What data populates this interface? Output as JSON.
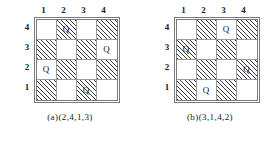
{
  "figure_type": "chessboard-permutation-diagram",
  "boards": [
    {
      "id": "board-a",
      "caption": "(a)(2,4,1,3)",
      "col_labels": [
        "1",
        "2",
        "3",
        "4"
      ],
      "row_labels": [
        "4",
        "3",
        "2",
        "1"
      ],
      "queen_glyph": "Q",
      "permutation": [
        2,
        4,
        1,
        3
      ],
      "rows_top_to_bottom": [
        {
          "row_label": "4",
          "cells": [
            {
              "col": "1",
              "shaded": false,
              "queen": ""
            },
            {
              "col": "2",
              "shaded": true,
              "queen": "Q"
            },
            {
              "col": "3",
              "shaded": false,
              "queen": ""
            },
            {
              "col": "4",
              "shaded": true,
              "queen": ""
            }
          ]
        },
        {
          "row_label": "3",
          "cells": [
            {
              "col": "1",
              "shaded": true,
              "queen": ""
            },
            {
              "col": "2",
              "shaded": false,
              "queen": ""
            },
            {
              "col": "3",
              "shaded": true,
              "queen": ""
            },
            {
              "col": "4",
              "shaded": false,
              "queen": "Q"
            }
          ]
        },
        {
          "row_label": "2",
          "cells": [
            {
              "col": "1",
              "shaded": false,
              "queen": "Q"
            },
            {
              "col": "2",
              "shaded": true,
              "queen": ""
            },
            {
              "col": "3",
              "shaded": false,
              "queen": ""
            },
            {
              "col": "4",
              "shaded": true,
              "queen": ""
            }
          ]
        },
        {
          "row_label": "1",
          "cells": [
            {
              "col": "1",
              "shaded": true,
              "queen": ""
            },
            {
              "col": "2",
              "shaded": false,
              "queen": ""
            },
            {
              "col": "3",
              "shaded": true,
              "queen": "Q"
            },
            {
              "col": "4",
              "shaded": false,
              "queen": ""
            }
          ]
        }
      ]
    },
    {
      "id": "board-b",
      "caption": "(b)(3,1,4,2)",
      "col_labels": [
        "1",
        "2",
        "3",
        "4"
      ],
      "row_labels": [
        "4",
        "3",
        "2",
        "1"
      ],
      "queen_glyph": "Q",
      "permutation": [
        3,
        1,
        4,
        2
      ],
      "rows_top_to_bottom": [
        {
          "row_label": "4",
          "cells": [
            {
              "col": "1",
              "shaded": false,
              "queen": ""
            },
            {
              "col": "2",
              "shaded": true,
              "queen": ""
            },
            {
              "col": "3",
              "shaded": false,
              "queen": "Q"
            },
            {
              "col": "4",
              "shaded": true,
              "queen": ""
            }
          ]
        },
        {
          "row_label": "3",
          "cells": [
            {
              "col": "1",
              "shaded": true,
              "queen": "Q"
            },
            {
              "col": "2",
              "shaded": false,
              "queen": ""
            },
            {
              "col": "3",
              "shaded": true,
              "queen": ""
            },
            {
              "col": "4",
              "shaded": false,
              "queen": ""
            }
          ]
        },
        {
          "row_label": "2",
          "cells": [
            {
              "col": "1",
              "shaded": false,
              "queen": ""
            },
            {
              "col": "2",
              "shaded": true,
              "queen": ""
            },
            {
              "col": "3",
              "shaded": false,
              "queen": ""
            },
            {
              "col": "4",
              "shaded": true,
              "queen": "Q"
            }
          ]
        },
        {
          "row_label": "1",
          "cells": [
            {
              "col": "1",
              "shaded": true,
              "queen": ""
            },
            {
              "col": "2",
              "shaded": false,
              "queen": "Q"
            },
            {
              "col": "3",
              "shaded": true,
              "queen": ""
            },
            {
              "col": "4",
              "shaded": false,
              "queen": ""
            }
          ]
        }
      ]
    }
  ]
}
